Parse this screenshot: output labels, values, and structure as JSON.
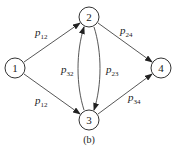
{
  "diagram": {
    "caption": "(b)",
    "nodes": [
      {
        "id": "1",
        "label": "1",
        "x": 15,
        "y": 68
      },
      {
        "id": "2",
        "label": "2",
        "x": 89,
        "y": 17
      },
      {
        "id": "3",
        "label": "3",
        "x": 89,
        "y": 120
      },
      {
        "id": "4",
        "label": "4",
        "x": 161,
        "y": 68
      }
    ],
    "edges": [
      {
        "from": "1",
        "to": "2",
        "label_main": "p",
        "label_sub": "12"
      },
      {
        "from": "1",
        "to": "3",
        "label_main": "p",
        "label_sub": "12"
      },
      {
        "from": "3",
        "to": "2",
        "label_main": "p",
        "label_sub": "32"
      },
      {
        "from": "2",
        "to": "3",
        "label_main": "p",
        "label_sub": "23"
      },
      {
        "from": "2",
        "to": "4",
        "label_main": "p",
        "label_sub": "24"
      },
      {
        "from": "3",
        "to": "4",
        "label_main": "p",
        "label_sub": "34"
      }
    ]
  }
}
